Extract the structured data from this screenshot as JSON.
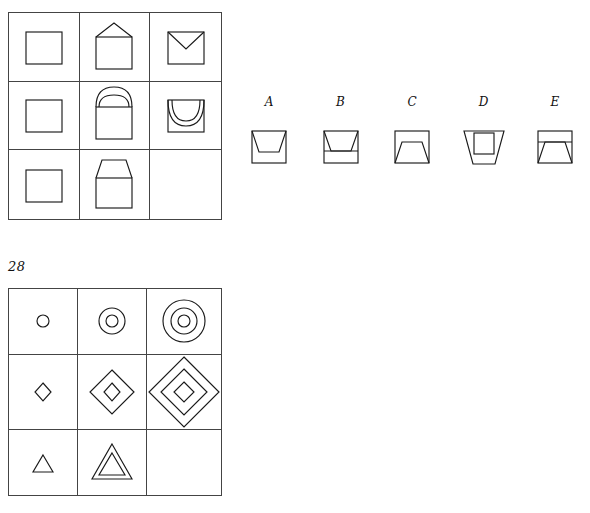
{
  "puzzles": [
    {
      "id": "puzzle-1",
      "label": "",
      "matrix": {
        "name": "matrix-grid-1",
        "rows": 3,
        "cols": 3,
        "cells": [
          {
            "name": "cell-r1c1",
            "figure": "square",
            "description": "plain square"
          },
          {
            "name": "cell-r1c2",
            "figure": "square-with-triangle-roof",
            "description": "square with triangle roof above"
          },
          {
            "name": "cell-r1c3",
            "figure": "square-with-inner-v",
            "description": "square with inward V at top"
          },
          {
            "name": "cell-r2c1",
            "figure": "square",
            "description": "plain square"
          },
          {
            "name": "cell-r2c2",
            "figure": "square-with-double-arch-roof",
            "description": "square with two nested arcs above"
          },
          {
            "name": "cell-r2c3",
            "figure": "square-with-inner-double-arc",
            "description": "square with two nested downward arcs inside"
          },
          {
            "name": "cell-r3c1",
            "figure": "square",
            "description": "plain square"
          },
          {
            "name": "cell-r3c2",
            "figure": "square-with-trapezoid-roof",
            "description": "square with upright trapezoid above"
          },
          {
            "name": "cell-r3c3",
            "figure": "empty",
            "description": "missing piece"
          }
        ]
      },
      "options": [
        {
          "label": "A",
          "name": "option-a",
          "figure": "square-with-inner-inverted-trapezoid-top"
        },
        {
          "label": "B",
          "name": "option-b",
          "figure": "square-with-inner-inverted-trapezoid-and-line"
        },
        {
          "label": "C",
          "name": "option-c",
          "figure": "square-with-inner-upright-trapezoid-bottom"
        },
        {
          "label": "D",
          "name": "option-d",
          "figure": "inverted-trapezoid-with-inner-square"
        },
        {
          "label": "E",
          "name": "option-e",
          "figure": "square-with-line-and-upright-trapezoid"
        }
      ]
    },
    {
      "id": "puzzle-2",
      "label": "28",
      "matrix": {
        "name": "matrix-grid-2",
        "rows": 3,
        "cols": 3,
        "cells": [
          {
            "name": "cell-r1c1",
            "figure": "circle-x1",
            "description": "one small circle"
          },
          {
            "name": "cell-r1c2",
            "figure": "circle-x2",
            "description": "two nested circles"
          },
          {
            "name": "cell-r1c3",
            "figure": "circle-x3",
            "description": "three nested circles"
          },
          {
            "name": "cell-r2c1",
            "figure": "diamond-x1",
            "description": "one small diamond"
          },
          {
            "name": "cell-r2c2",
            "figure": "diamond-x2",
            "description": "two nested diamonds"
          },
          {
            "name": "cell-r2c3",
            "figure": "diamond-x3",
            "description": "three nested diamonds"
          },
          {
            "name": "cell-r3c1",
            "figure": "triangle-x1",
            "description": "one small triangle"
          },
          {
            "name": "cell-r3c2",
            "figure": "triangle-x2",
            "description": "two nested triangles"
          },
          {
            "name": "cell-r3c3",
            "figure": "empty",
            "description": "missing piece"
          }
        ]
      },
      "options": [
        {
          "label": "J",
          "name": "option-j",
          "figure": "circle-with-two-nested-triangles"
        },
        {
          "label": "K",
          "name": "option-k",
          "figure": "three-nested-triangles"
        },
        {
          "label": "L",
          "name": "option-l",
          "figure": "triangle-with-diamond-and-circle"
        },
        {
          "label": "M",
          "name": "option-m",
          "figure": "two-nested-inverted-triangles"
        },
        {
          "label": "N",
          "name": "option-n",
          "figure": "single-triangle"
        }
      ]
    }
  ]
}
